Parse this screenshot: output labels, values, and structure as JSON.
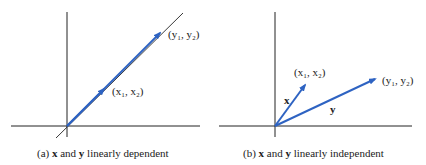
{
  "panels": [
    {
      "caption_prefix": "(a) ",
      "caption_x": "x",
      "caption_and": " and ",
      "caption_y": "y",
      "caption_suffix": " linearly dependent",
      "point_x_label": "(x₁, x₂)",
      "point_y_label": "(y₁, y₂)"
    },
    {
      "caption_prefix": "(b) ",
      "caption_x": "x",
      "caption_and": " and ",
      "caption_y": "y",
      "caption_suffix": " linearly independent",
      "point_x_label": "(x₁, x₂)",
      "point_y_label": "(y₁, y₂)",
      "vector_x_label": "x",
      "vector_y_label": "y"
    }
  ],
  "colors": {
    "vector": "#2e63c2",
    "axis": "#222222"
  }
}
